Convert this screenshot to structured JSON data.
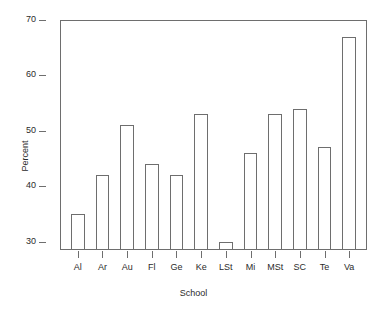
{
  "chart_data": {
    "type": "bar",
    "title": "",
    "xlabel": "School",
    "ylabel": "Percent",
    "categories": [
      "Al",
      "Ar",
      "Au",
      "Fl",
      "Ge",
      "Ke",
      "LSt",
      "Mi",
      "MSt",
      "SC",
      "Te",
      "Va"
    ],
    "values": [
      35,
      42,
      51,
      44,
      42,
      53,
      30,
      46,
      53,
      54,
      47,
      67
    ],
    "ylim": [
      28.5,
      70
    ],
    "y_ticks": [
      30,
      40,
      50,
      60,
      70
    ],
    "y_tick_labels": [
      "30",
      "40",
      "50",
      "60",
      "70"
    ],
    "grid": false,
    "legend": null,
    "bar_fill": "#ffffff",
    "bar_border": "#6e6e6e",
    "axis_color": "#6e6e6e",
    "text_color": "#2b2b2b",
    "background": "#ffffff"
  }
}
